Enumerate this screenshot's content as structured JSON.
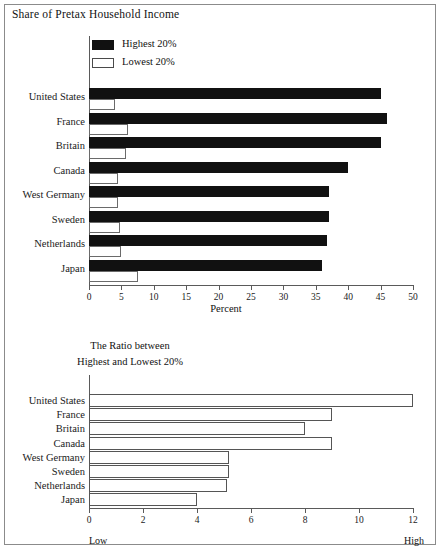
{
  "figure": {
    "title": "Share of Pretax Household Income"
  },
  "legend": {
    "items": [
      {
        "label": "Highest 20%",
        "swatch": "filled-black"
      },
      {
        "label": "Lowest 20%",
        "swatch": "hollow-white"
      }
    ]
  },
  "top_panel": {
    "xlabel": "Percent"
  },
  "bottom_panel": {
    "caption_line1": "The Ratio between",
    "caption_line2": "Highest and Lowest 20%",
    "low_label": "Low",
    "high_label": "High"
  },
  "chart_data": [
    {
      "type": "bar",
      "orientation": "horizontal",
      "title": "Share of Pretax Household Income",
      "xlabel": "Percent",
      "ylabel": "",
      "xlim": [
        0,
        50
      ],
      "xticks": [
        0,
        5,
        10,
        15,
        20,
        25,
        30,
        35,
        40,
        45,
        50
      ],
      "grid": false,
      "legend_position": "top-left",
      "categories": [
        "United States",
        "France",
        "Britain",
        "Canada",
        "West Germany",
        "Sweden",
        "Netherlands",
        "Japan"
      ],
      "series": [
        {
          "name": "Highest 20%",
          "color": "#111111",
          "values": [
            45.0,
            46.0,
            45.0,
            40.0,
            37.0,
            37.0,
            36.7,
            36.0
          ]
        },
        {
          "name": "Lowest 20%",
          "color": "#ffffff",
          "values": [
            4.0,
            6.0,
            5.7,
            4.5,
            4.5,
            4.8,
            5.0,
            7.5
          ]
        }
      ]
    },
    {
      "type": "bar",
      "orientation": "horizontal",
      "title": "The Ratio between Highest and Lowest 20%",
      "xlabel": "",
      "ylabel": "",
      "xlim": [
        0,
        12
      ],
      "xticks": [
        0,
        2,
        4,
        6,
        8,
        10,
        12
      ],
      "grid": false,
      "annotations": [
        "Low",
        "High"
      ],
      "categories": [
        "United States",
        "France",
        "Britain",
        "Canada",
        "West Germany",
        "Sweden",
        "Netherlands",
        "Japan"
      ],
      "values": [
        12.0,
        9.0,
        8.0,
        9.0,
        5.2,
        5.2,
        5.1,
        4.0
      ]
    }
  ]
}
